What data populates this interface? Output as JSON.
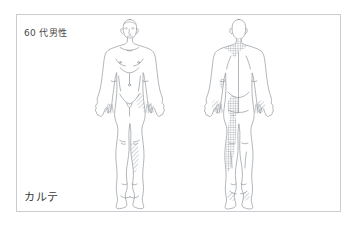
{
  "document": {
    "type": "medical-body-chart",
    "title_label": "カルテ",
    "patient_label": "60 代男性",
    "frame": {
      "border_color": "#c9ccd1",
      "background_color": "#ffffff"
    }
  },
  "figures": [
    {
      "id": "anterior",
      "view_label": "front",
      "sex": "male",
      "has_face": true,
      "outline_color": "#8a8f96",
      "marked_regions": [
        {
          "name": "right-hand",
          "pattern": "hatched",
          "side": "patient-left"
        },
        {
          "name": "right-lower-leg-shin",
          "pattern": "hatched",
          "side": "patient-left"
        },
        {
          "name": "right-hip-flank",
          "pattern": "hatched",
          "side": "patient-left"
        }
      ]
    },
    {
      "id": "posterior",
      "view_label": "back",
      "sex": "male",
      "has_face": false,
      "outline_color": "#8a8f96",
      "marked_regions": [
        {
          "name": "posterior-neck-upper-back",
          "pattern": "cross-hatched",
          "side": "midline"
        },
        {
          "name": "left-buttock",
          "pattern": "cross-hatched",
          "side": "patient-right"
        },
        {
          "name": "left-posterior-leg",
          "pattern": "cross-hatched",
          "side": "patient-right"
        },
        {
          "name": "left-upper-arm",
          "pattern": "cross-hatched",
          "side": "patient-right"
        },
        {
          "name": "left-hand",
          "pattern": "hatched",
          "side": "patient-right"
        },
        {
          "name": "right-hand",
          "pattern": "hatched",
          "side": "patient-left"
        },
        {
          "name": "feet",
          "pattern": "hatched",
          "side": "both"
        }
      ]
    }
  ],
  "colors": {
    "outline": "#8a8f96",
    "hatch": "#9aa0a6",
    "text": "#3a3a3a",
    "border": "#c9ccd1"
  }
}
